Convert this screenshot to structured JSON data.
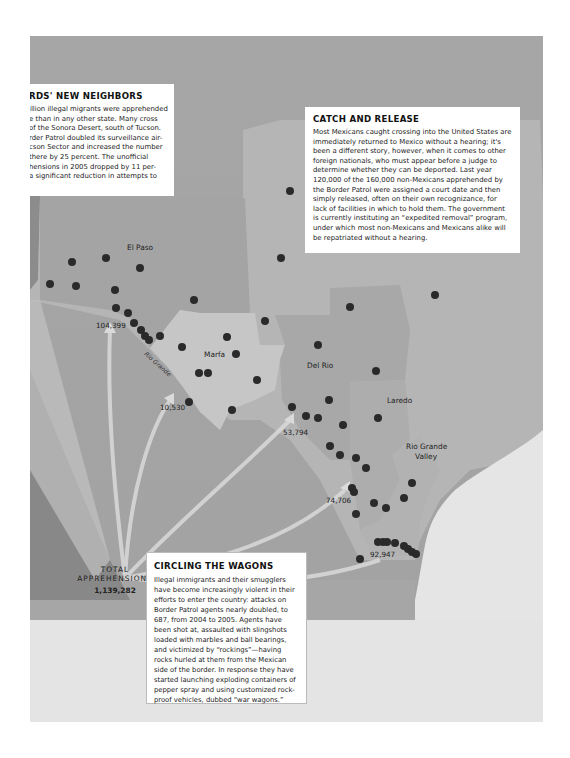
{
  "boxes": {
    "neighbors": {
      "title": "RDS' NEW NEIGHBORS",
      "lines": [
        "illion illegal migrants were apprehended",
        "e than in any other state. Many cross",
        "of the Sonora Desert, south of Tucson.",
        "rder Patrol doubled its surveillance air-",
        "cson Sector and increased the number",
        " there by 25 percent. The unofficial",
        "hensions in 2005 dropped by 11 per-",
        "a significant reduction in attempts to"
      ]
    },
    "catch": {
      "title": "CATCH AND RELEASE",
      "body": "Most Mexicans caught crossing into the United States are immediately returned to Mexico without a hearing; it's been a different story, however, when it comes to other foreign nationals, who must appear before a judge to determine whether they can be deported. Last year 120,000 of the 160,000 non-Mexicans apprehended by the Border Patrol were assigned a court date and then simply released, often on their own recognizance, for lack of facilities in which to hold them. The government is currently instituting an “expedited removal” program, under which most non-Mexicans and Mexicans alike will be repatriated without a hearing."
    },
    "wagons": {
      "title": "CIRCLING THE WAGONS",
      "body": "Illegal immigrants and their smugglers have become increasingly violent in their efforts to enter the country: attacks on Border Patrol agents nearly doubled, to 687, from 2004 to 2005. Agents have been shot at, assaulted with slingshots loaded with marbles and ball bearings, and victimized by “rockings”—having rocks hurled at them from the Mexican side of the border. In response they have started launching exploding containers of pepper spray and using customized rock-proof vehicles, dubbed “war wagons.”"
    }
  },
  "sectors": {
    "el_paso": "El Paso",
    "marfa": "Marfa",
    "del_rio": "Del Rio",
    "laredo": "Laredo",
    "rgv_1": "Rio Grande",
    "rgv_2": "Valley"
  },
  "river_label": "Rio Grande",
  "apprehensions": {
    "el_paso": "104,399",
    "marfa": "10,530",
    "del_rio": "53,794",
    "laredo": "74,706",
    "rgv": "92,947"
  },
  "total": {
    "label_1": "TOTAL",
    "label_2": "APPREHENSIONS",
    "value": "1,139,282"
  },
  "colors": {
    "map_base": "#9a9a9a",
    "sector_el_paso": "#a8a8a8",
    "sector_marfa": "#c4c4c4",
    "sector_del_rio": "#a9a9a9",
    "sector_laredo": "#b0b0b0",
    "sector_rgv": "#b4b4b4",
    "texas_outer": "#bababa",
    "gulf": "#e6e6e6",
    "dot": "#2a2a2a"
  },
  "stations": [
    [
      50,
      284
    ],
    [
      72,
      262
    ],
    [
      76,
      286
    ],
    [
      106,
      258
    ],
    [
      140,
      268
    ],
    [
      115,
      290
    ],
    [
      116,
      308
    ],
    [
      128,
      313
    ],
    [
      134,
      323
    ],
    [
      141,
      330
    ],
    [
      145,
      336
    ],
    [
      149,
      340
    ],
    [
      160,
      336
    ],
    [
      194,
      300
    ],
    [
      182,
      347
    ],
    [
      227,
      337
    ],
    [
      236,
      354
    ],
    [
      199,
      373
    ],
    [
      208,
      373
    ],
    [
      189,
      402
    ],
    [
      232,
      410
    ],
    [
      257,
      380
    ],
    [
      265,
      321
    ],
    [
      281,
      258
    ],
    [
      290,
      191
    ],
    [
      350,
      307
    ],
    [
      318,
      345
    ],
    [
      376,
      371
    ],
    [
      435,
      295
    ],
    [
      292,
      407
    ],
    [
      306,
      416
    ],
    [
      318,
      418
    ],
    [
      329,
      400
    ],
    [
      343,
      425
    ],
    [
      330,
      446
    ],
    [
      340,
      455
    ],
    [
      356,
      458
    ],
    [
      378,
      418
    ],
    [
      412,
      483
    ],
    [
      404,
      498
    ],
    [
      352,
      488
    ],
    [
      354,
      492
    ],
    [
      374,
      503
    ],
    [
      356,
      514
    ],
    [
      386,
      508
    ],
    [
      360,
      559
    ],
    [
      383,
      542
    ],
    [
      378,
      542
    ],
    [
      387,
      542
    ],
    [
      395,
      543
    ],
    [
      404,
      546
    ],
    [
      408,
      549
    ],
    [
      412,
      552
    ],
    [
      416,
      554
    ],
    [
      366,
      468
    ]
  ]
}
